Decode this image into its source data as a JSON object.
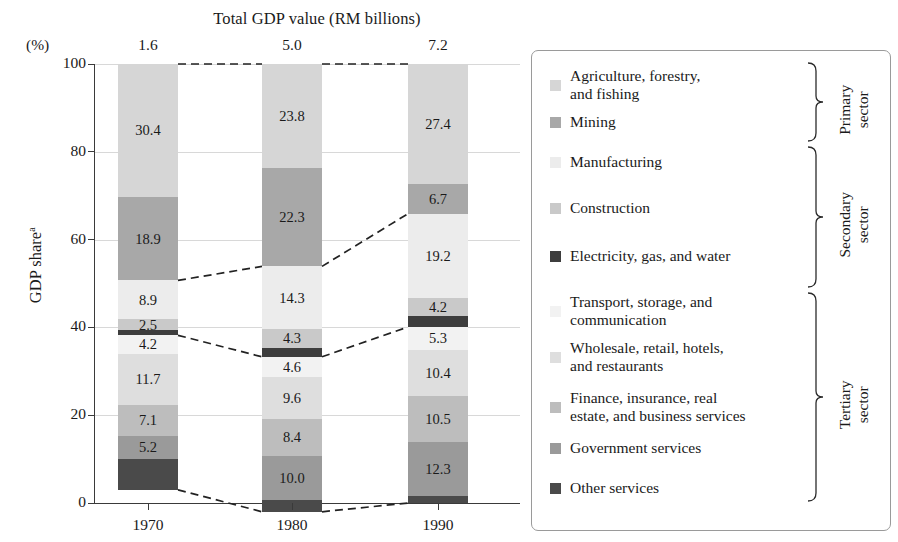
{
  "chart_data": {
    "type": "bar",
    "stacked": true,
    "title": "Total GDP value (RM billions)",
    "ylabel": "GDP share",
    "ylabel_superscript": "a",
    "yunit_label": "(%)",
    "xlabel": "",
    "ylim": [
      0,
      100
    ],
    "yticks": [
      0,
      20,
      40,
      60,
      80,
      100
    ],
    "grid": true,
    "legend_position": "right",
    "categories": [
      "1970",
      "1980",
      "1990"
    ],
    "totals_label": "Total GDP value (RM billions)",
    "totals": [
      "1.6",
      "5.0",
      "7.2"
    ],
    "series": [
      {
        "name": "Agriculture, forestry, and fishing",
        "color": "#d6d6d6",
        "values": [
          30.4,
          23.8,
          27.4
        ],
        "labels": [
          "30.4",
          "23.8",
          "27.4"
        ]
      },
      {
        "name": "Mining",
        "color": "#a8a8a8",
        "values": [
          18.9,
          22.3,
          6.7
        ],
        "labels": [
          "18.9",
          "22.3",
          "6.7"
        ]
      },
      {
        "name": "Manufacturing",
        "color": "#ececec",
        "values": [
          8.9,
          14.3,
          19.2
        ],
        "labels": [
          "8.9",
          "14.3",
          "19.2"
        ]
      },
      {
        "name": "Construction",
        "color": "#c9c9c9",
        "values": [
          2.5,
          4.3,
          4.2
        ],
        "labels": [
          "2.5",
          "4.3",
          "4.2"
        ]
      },
      {
        "name": "Electricity, gas, and water",
        "color": "#3d3d3d",
        "values": [
          1.1,
          2.0,
          2.4
        ],
        "labels": [
          "",
          "",
          ""
        ]
      },
      {
        "name": "Transport, storage, and communication",
        "color": "#f2f2f2",
        "values": [
          4.2,
          4.6,
          5.3
        ],
        "labels": [
          "4.2",
          "4.6",
          "5.3"
        ]
      },
      {
        "name": "Wholesale, retail, hotels, and restaurants",
        "color": "#dedede",
        "values": [
          11.7,
          9.6,
          10.4
        ],
        "labels": [
          "11.7",
          "9.6",
          "10.4"
        ]
      },
      {
        "name": "Finance, insurance, real estate, and business services",
        "color": "#bdbdbd",
        "values": [
          7.1,
          8.4,
          10.5
        ],
        "labels": [
          "7.1",
          "8.4",
          "10.5"
        ]
      },
      {
        "name": "Government services",
        "color": "#9a9a9a",
        "values": [
          5.2,
          10.0,
          12.3
        ],
        "labels": [
          "5.2",
          "10.0",
          "12.3"
        ]
      },
      {
        "name": "Other services",
        "color": "#4a4a4a",
        "values": [
          7.0,
          2.7,
          1.6
        ],
        "labels": [
          "",
          "",
          ""
        ]
      }
    ]
  },
  "legend": {
    "items": [
      {
        "label": "Agriculture, forestry,\nand fishing",
        "color": "#d6d6d6",
        "icon": "legend-swatch"
      },
      {
        "label": "Mining",
        "color": "#a8a8a8",
        "icon": "legend-swatch"
      },
      {
        "label": "Manufacturing",
        "color": "#ececec",
        "icon": "legend-swatch"
      },
      {
        "label": "Construction",
        "color": "#c9c9c9",
        "icon": "legend-swatch"
      },
      {
        "label": "Electricity, gas, and water",
        "color": "#3d3d3d",
        "icon": "legend-swatch"
      },
      {
        "label": "Transport, storage, and\ncommunication",
        "color": "#f2f2f2",
        "icon": "legend-swatch"
      },
      {
        "label": "Wholesale, retail, hotels,\nand restaurants",
        "color": "#dedede",
        "icon": "legend-swatch"
      },
      {
        "label": "Finance, insurance, real\nestate, and business services",
        "color": "#bdbdbd",
        "icon": "legend-swatch"
      },
      {
        "label": "Government services",
        "color": "#9a9a9a",
        "icon": "legend-swatch"
      },
      {
        "label": "Other services",
        "color": "#4a4a4a",
        "icon": "legend-swatch"
      }
    ],
    "sectors": [
      {
        "label": "Primary\nsector"
      },
      {
        "label": "Secondary\nsector"
      },
      {
        "label": "Tertiary\nsector"
      }
    ]
  }
}
